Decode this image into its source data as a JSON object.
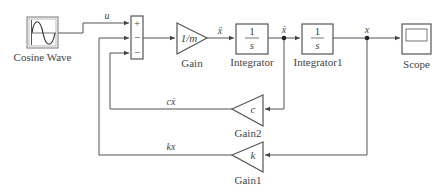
{
  "diagram": {
    "type": "simulink-block-diagram",
    "blocks": {
      "source": {
        "label": "Cosine Wave",
        "icon": "sine-wave-icon"
      },
      "sum": {
        "signs": [
          "+",
          "−",
          "−"
        ]
      },
      "gain": {
        "label": "Gain",
        "value": "1/m"
      },
      "integrator": {
        "label": "Integrator",
        "numerator": "1",
        "denominator": "s"
      },
      "integrator1": {
        "label": "Integrator1",
        "numerator": "1",
        "denominator": "s"
      },
      "scope": {
        "label": "Scope",
        "icon": "scope-screen-icon"
      },
      "gain2": {
        "label": "Gain2",
        "value": "c"
      },
      "gain1": {
        "label": "Gain1",
        "value": "k"
      }
    },
    "signals": {
      "input": "u",
      "acceleration": "ẍ",
      "velocity": "ẋ",
      "position": "x",
      "damping_feedback": "cẋ",
      "spring_feedback": "kx"
    },
    "colors": {
      "line": "#555555",
      "text": "#444444",
      "background": "#ffffff"
    }
  }
}
